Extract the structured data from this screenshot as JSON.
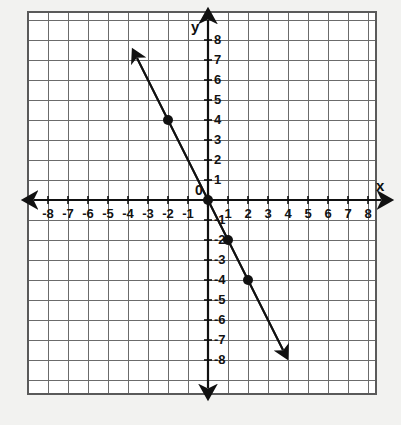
{
  "figure": {
    "kind": "coordinate-plane-line-graph",
    "axis_labels": {
      "x": "x",
      "y": "y"
    },
    "origin_label": "0"
  },
  "chart_data": {
    "type": "line",
    "title": "",
    "xlabel": "x",
    "ylabel": "y",
    "xlim": [
      -9,
      9
    ],
    "ylim": [
      -9.5,
      9.5
    ],
    "grid": true,
    "grid_step": 1,
    "legend": "none",
    "x_tick_labels": [
      "-8",
      "-7",
      "-6",
      "-5",
      "-4",
      "-3",
      "-2",
      "-1",
      "1",
      "2",
      "3",
      "4",
      "5",
      "6",
      "7",
      "8"
    ],
    "x_tick_values": [
      -8,
      -7,
      -6,
      -5,
      -4,
      -3,
      -2,
      -1,
      1,
      2,
      3,
      4,
      5,
      6,
      7,
      8
    ],
    "y_tick_labels": [
      "8",
      "7",
      "6",
      "5",
      "4",
      "3",
      "2",
      "1",
      "-1",
      "-2",
      "-3",
      "-4",
      "-5",
      "-6",
      "-7",
      "-8"
    ],
    "y_tick_values": [
      8,
      7,
      6,
      5,
      4,
      3,
      2,
      1,
      -1,
      -2,
      -3,
      -4,
      -5,
      -6,
      -7,
      -8
    ],
    "series": [
      {
        "name": "line",
        "equation": "y = -2x",
        "slope": -2,
        "y_intercept": 0,
        "style": "solid-double-arrow",
        "endpoints": [
          [
            -3.55,
            7.1
          ],
          [
            3.75,
            -7.5
          ]
        ],
        "marked_points": [
          {
            "x": -2,
            "y": 4
          },
          {
            "x": 0,
            "y": 0
          },
          {
            "x": 1,
            "y": -2
          },
          {
            "x": 2,
            "y": -4
          }
        ]
      }
    ]
  },
  "colors": {
    "ink": "#111111",
    "grid": "#6b6b6b",
    "plot_background": "#ffffff",
    "page_background": "#f2f2f0"
  }
}
